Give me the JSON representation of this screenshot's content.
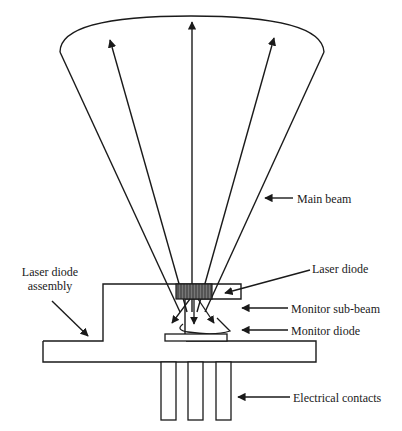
{
  "diagram": {
    "title": "",
    "colors": {
      "stroke": "#1a1a1a",
      "background": "#ffffff",
      "diode_fill": "#555555"
    },
    "labels": {
      "main_beam": "Main beam",
      "laser_diode": "Laser diode",
      "monitor_sub_beam": "Monitor sub-beam",
      "monitor_diode": "Monitor diode",
      "electrical_contacts": "Electrical contacts",
      "assembly_line1": "Laser diode",
      "assembly_line2": "assembly"
    },
    "components": [
      "main-beam-cone",
      "laser-diode-chip",
      "monitor-sub-beam",
      "monitor-diode",
      "mount-base",
      "electrical-contacts"
    ]
  }
}
